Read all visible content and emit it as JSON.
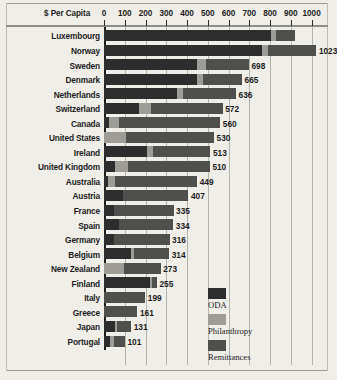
{
  "chart_data": {
    "type": "bar",
    "orientation": "horizontal",
    "stacked": true,
    "title": "",
    "xlabel": "$ Per Capita",
    "ylabel": "",
    "xlim": [
      0,
      1050
    ],
    "grid": true,
    "tick_labels": [
      "0",
      "100",
      "200",
      "300",
      "400",
      "500",
      "600",
      "700",
      "800",
      "900",
      "1000"
    ],
    "tick_values": [
      0,
      100,
      200,
      300,
      400,
      500,
      600,
      700,
      800,
      900,
      1000
    ],
    "legend_position": "inside-bottom-right",
    "series": [
      {
        "name": "ODA",
        "color": "#2d2d2d"
      },
      {
        "name": "Philanthropy",
        "color": "#9d9c97"
      },
      {
        "name": "Remittances",
        "color": "#4f4f4e"
      }
    ],
    "categories": [
      "Luxembourg",
      "Norway",
      "Sweden",
      "Denmark",
      "Netherlands",
      "Switzerland",
      "Canada",
      "United States",
      "Ireland",
      "United Kingdom",
      "Australia",
      "Austria",
      "France",
      "Spain",
      "Germany",
      "Belgium",
      "New Zealand",
      "Finland",
      "Italy",
      "Greece",
      "Japan",
      "Portugal"
    ],
    "rows": [
      {
        "label": "Luxembourg",
        "total": "",
        "oda": 805,
        "philanthropy": 22,
        "remittances": 95
      },
      {
        "label": "Norway",
        "total": "1023",
        "oda": 760,
        "philanthropy": 32,
        "remittances": 231
      },
      {
        "label": "Sweden",
        "total": "698",
        "oda": 450,
        "philanthropy": 40,
        "remittances": 208
      },
      {
        "label": "Denmark",
        "total": "665",
        "oda": 450,
        "philanthropy": 25,
        "remittances": 190
      },
      {
        "label": "Netherlands",
        "total": "636",
        "oda": 352,
        "philanthropy": 30,
        "remittances": 254
      },
      {
        "label": "Switzerland",
        "total": "572",
        "oda": 170,
        "philanthropy": 55,
        "remittances": 347
      },
      {
        "label": "Canada",
        "total": "560",
        "oda": 25,
        "philanthropy": 45,
        "remittances": 490
      },
      {
        "label": "United States",
        "total": "530",
        "oda": 0,
        "philanthropy": 108,
        "remittances": 422
      },
      {
        "label": "Ireland",
        "total": "513",
        "oda": 205,
        "philanthropy": 30,
        "remittances": 278
      },
      {
        "label": "United Kingdom",
        "total": "510",
        "oda": 55,
        "philanthropy": 62,
        "remittances": 393
      },
      {
        "label": "Australia",
        "total": "449",
        "oda": 18,
        "philanthropy": 35,
        "remittances": 396
      },
      {
        "label": "Austria",
        "total": "407",
        "oda": 90,
        "philanthropy": 0,
        "remittances": 317
      },
      {
        "label": "France",
        "total": "335",
        "oda": 48,
        "philanthropy": 0,
        "remittances": 287
      },
      {
        "label": "Spain",
        "total": "334",
        "oda": 70,
        "philanthropy": 0,
        "remittances": 264
      },
      {
        "label": "Germany",
        "total": "316",
        "oda": 50,
        "philanthropy": 0,
        "remittances": 266
      },
      {
        "label": "Belgium",
        "total": "314",
        "oda": 130,
        "philanthropy": 16,
        "remittances": 168
      },
      {
        "label": "New Zealand",
        "total": "273",
        "oda": 0,
        "philanthropy": 95,
        "remittances": 178
      },
      {
        "label": "Finland",
        "total": "255",
        "oda": 220,
        "philanthropy": 12,
        "remittances": 23
      },
      {
        "label": "Italy",
        "total": "199",
        "oda": 0,
        "philanthropy": 0,
        "remittances": 199
      },
      {
        "label": "Greece",
        "total": "161",
        "oda": 0,
        "philanthropy": 0,
        "remittances": 161
      },
      {
        "label": "Japan",
        "total": "131",
        "oda": 55,
        "philanthropy": 10,
        "remittances": 66
      },
      {
        "label": "Portugal",
        "total": "101",
        "oda": 28,
        "philanthropy": 18,
        "remittances": 55
      }
    ]
  },
  "legend": {
    "items": [
      {
        "label": "ODA",
        "color": "#2d2d2d"
      },
      {
        "label": "Philanthropy",
        "color": "#9d9c97"
      },
      {
        "label": "Remittances",
        "color": "#4f4f4e"
      }
    ]
  }
}
